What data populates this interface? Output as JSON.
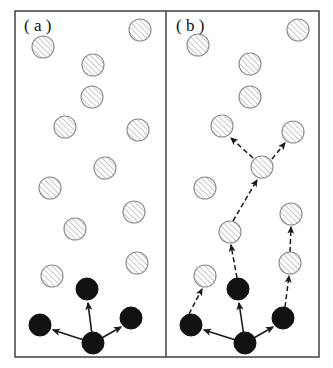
{
  "figure": {
    "type": "diagram",
    "width": 333,
    "height": 368,
    "background_color": "#ffffff",
    "frame": {
      "x": 15,
      "y": 11,
      "width": 304,
      "height": 346,
      "stroke_color": "#4d4d4d",
      "stroke_width": 1.6,
      "divider_x": 166
    },
    "panels": [
      {
        "id": "a",
        "label": "( a )",
        "label_x": 24,
        "label_y": 31
      },
      {
        "id": "b",
        "label": "( b )",
        "label_x": 176,
        "label_y": 31
      }
    ],
    "style": {
      "circle_radius": 11,
      "hatched_fill": "#ffffff",
      "hatched_stroke": "#8c8c8c",
      "hatch_line_color": "#9a9a9a",
      "filled_color": "#111111",
      "solid_arrow_color": "#1a1a1a",
      "dashed_arrow_color": "#1a1a1a",
      "dash_pattern": "5,3"
    },
    "circles_a": [
      {
        "name": "a-hatched-1",
        "x": 43,
        "y": 47,
        "kind": "hatched"
      },
      {
        "name": "a-hatched-2",
        "x": 140,
        "y": 30,
        "kind": "hatched"
      },
      {
        "name": "a-hatched-3",
        "x": 93,
        "y": 65,
        "kind": "hatched"
      },
      {
        "name": "a-hatched-4",
        "x": 92,
        "y": 97,
        "kind": "hatched"
      },
      {
        "name": "a-hatched-5",
        "x": 65,
        "y": 127,
        "kind": "hatched"
      },
      {
        "name": "a-hatched-6",
        "x": 138,
        "y": 130,
        "kind": "hatched"
      },
      {
        "name": "a-hatched-7",
        "x": 105,
        "y": 168,
        "kind": "hatched"
      },
      {
        "name": "a-hatched-8",
        "x": 50,
        "y": 188,
        "kind": "hatched"
      },
      {
        "name": "a-hatched-9",
        "x": 134,
        "y": 212,
        "kind": "hatched"
      },
      {
        "name": "a-hatched-10",
        "x": 75,
        "y": 229,
        "kind": "hatched"
      },
      {
        "name": "a-hatched-11",
        "x": 137,
        "y": 263,
        "kind": "hatched"
      },
      {
        "name": "a-hatched-12",
        "x": 52,
        "y": 276,
        "kind": "hatched"
      },
      {
        "name": "a-filled-top",
        "x": 87,
        "y": 289,
        "kind": "filled"
      },
      {
        "name": "a-filled-left",
        "x": 40,
        "y": 325,
        "kind": "filled"
      },
      {
        "name": "a-filled-right",
        "x": 131,
        "y": 318,
        "kind": "filled"
      },
      {
        "name": "a-filled-center",
        "x": 93,
        "y": 343,
        "kind": "filled"
      }
    ],
    "arrows_a": [
      {
        "name": "a-arrow-center-to-top",
        "x1": 93,
        "y1": 343,
        "x2": 88,
        "y2": 303,
        "style": "solid"
      },
      {
        "name": "a-arrow-center-to-left",
        "x1": 93,
        "y1": 343,
        "x2": 53,
        "y2": 330,
        "style": "solid"
      },
      {
        "name": "a-arrow-center-to-right",
        "x1": 93,
        "y1": 343,
        "x2": 121,
        "y2": 327,
        "style": "solid"
      }
    ],
    "circles_b": [
      {
        "name": "b-hatched-1",
        "x": 198,
        "y": 45,
        "kind": "hatched"
      },
      {
        "name": "b-hatched-2",
        "x": 298,
        "y": 30,
        "kind": "hatched"
      },
      {
        "name": "b-hatched-3",
        "x": 250,
        "y": 64,
        "kind": "hatched"
      },
      {
        "name": "b-hatched-4",
        "x": 250,
        "y": 97,
        "kind": "hatched"
      },
      {
        "name": "b-hatched-5",
        "x": 222,
        "y": 126,
        "kind": "hatched"
      },
      {
        "name": "b-hatched-6",
        "x": 293,
        "y": 132,
        "kind": "hatched"
      },
      {
        "name": "b-hatched-node-upper",
        "x": 262,
        "y": 167,
        "kind": "hatched"
      },
      {
        "name": "b-hatched-7",
        "x": 205,
        "y": 188,
        "kind": "hatched"
      },
      {
        "name": "b-hatched-8",
        "x": 291,
        "y": 214,
        "kind": "hatched"
      },
      {
        "name": "b-hatched-node-mid",
        "x": 230,
        "y": 232,
        "kind": "hatched"
      },
      {
        "name": "b-hatched-9",
        "x": 290,
        "y": 263,
        "kind": "hatched"
      },
      {
        "name": "b-hatched-10",
        "x": 205,
        "y": 276,
        "kind": "hatched"
      },
      {
        "name": "b-filled-top",
        "x": 238,
        "y": 289,
        "kind": "filled"
      },
      {
        "name": "b-filled-right",
        "x": 283,
        "y": 318,
        "kind": "filled"
      },
      {
        "name": "b-filled-left",
        "x": 191,
        "y": 325,
        "kind": "filled"
      },
      {
        "name": "b-filled-center",
        "x": 245,
        "y": 343,
        "kind": "filled"
      }
    ],
    "arrows_b": [
      {
        "name": "b-arrow-center-to-top",
        "x1": 245,
        "y1": 343,
        "x2": 239,
        "y2": 303,
        "style": "solid"
      },
      {
        "name": "b-arrow-center-to-left",
        "x1": 245,
        "y1": 343,
        "x2": 204,
        "y2": 330,
        "style": "solid"
      },
      {
        "name": "b-arrow-center-to-right",
        "x1": 245,
        "y1": 343,
        "x2": 273,
        "y2": 327,
        "style": "solid"
      },
      {
        "name": "b-arrow-left-to-hatched10",
        "x1": 189,
        "y1": 314,
        "x2": 202,
        "y2": 289,
        "style": "dashed"
      },
      {
        "name": "b-arrow-right-to-hatched9",
        "x1": 285,
        "y1": 307,
        "x2": 289,
        "y2": 276,
        "style": "dashed"
      },
      {
        "name": "b-arrow-hatched9-to-hatched8",
        "x1": 290,
        "y1": 252,
        "x2": 291,
        "y2": 227,
        "style": "dashed"
      },
      {
        "name": "b-arrow-top-to-midnode",
        "x1": 237,
        "y1": 278,
        "x2": 231,
        "y2": 245,
        "style": "dashed"
      },
      {
        "name": "b-arrow-midnode-to-uppernode",
        "x1": 233,
        "y1": 221,
        "x2": 257,
        "y2": 180,
        "style": "dashed"
      },
      {
        "name": "b-arrow-uppernode-to-hatched5",
        "x1": 253,
        "y1": 158,
        "x2": 231,
        "y2": 138,
        "style": "dashed"
      },
      {
        "name": "b-arrow-uppernode-to-hatched6",
        "x1": 272,
        "y1": 159,
        "x2": 285,
        "y2": 143,
        "style": "dashed"
      }
    ]
  }
}
